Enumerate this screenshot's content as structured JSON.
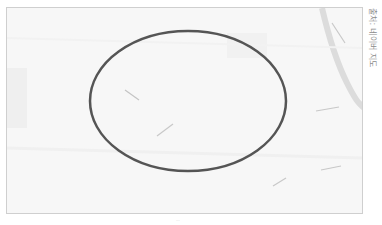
{
  "figure": {
    "caption": "출처: 네이버 지도",
    "footer_mark": "···"
  },
  "map": {
    "background": "#f7f7f7",
    "frame_border": "#cfcfcf",
    "road_color": "#dcdcdc",
    "label_color": "#bdbdbd",
    "highlight": {
      "shape": "ellipse",
      "stroke": "#555555",
      "stroke_width": 2.5,
      "cx": 181,
      "cy": 93,
      "rx": 98,
      "ry": 70
    }
  }
}
